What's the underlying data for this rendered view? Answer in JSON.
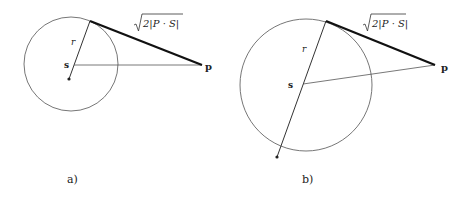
{
  "figure": {
    "panels": [
      {
        "id": "a",
        "caption": "a)",
        "center_label": "s",
        "point_label": "p",
        "radius_label": "r",
        "tangent_label": {
          "sqrt_arg": "2|P · S|",
          "sqrt_symbol": "√"
        },
        "description": "Point p outside small sphere centered at s with radius r; tangent segment length sqrt(2|P·S|)"
      },
      {
        "id": "b",
        "caption": "b)",
        "center_label": "s",
        "point_label": "p",
        "radius_label": "r",
        "tangent_label": {
          "sqrt_arg": "2|P · S|",
          "sqrt_symbol": "√"
        },
        "description": "Point p outside larger sphere centered at s with radius r; tangent segment length sqrt(2|P·S|)"
      }
    ],
    "colors": {
      "stroke": "#333333",
      "thin_stroke": "#555555",
      "tangent": "#111111",
      "background": "#ffffff"
    }
  }
}
